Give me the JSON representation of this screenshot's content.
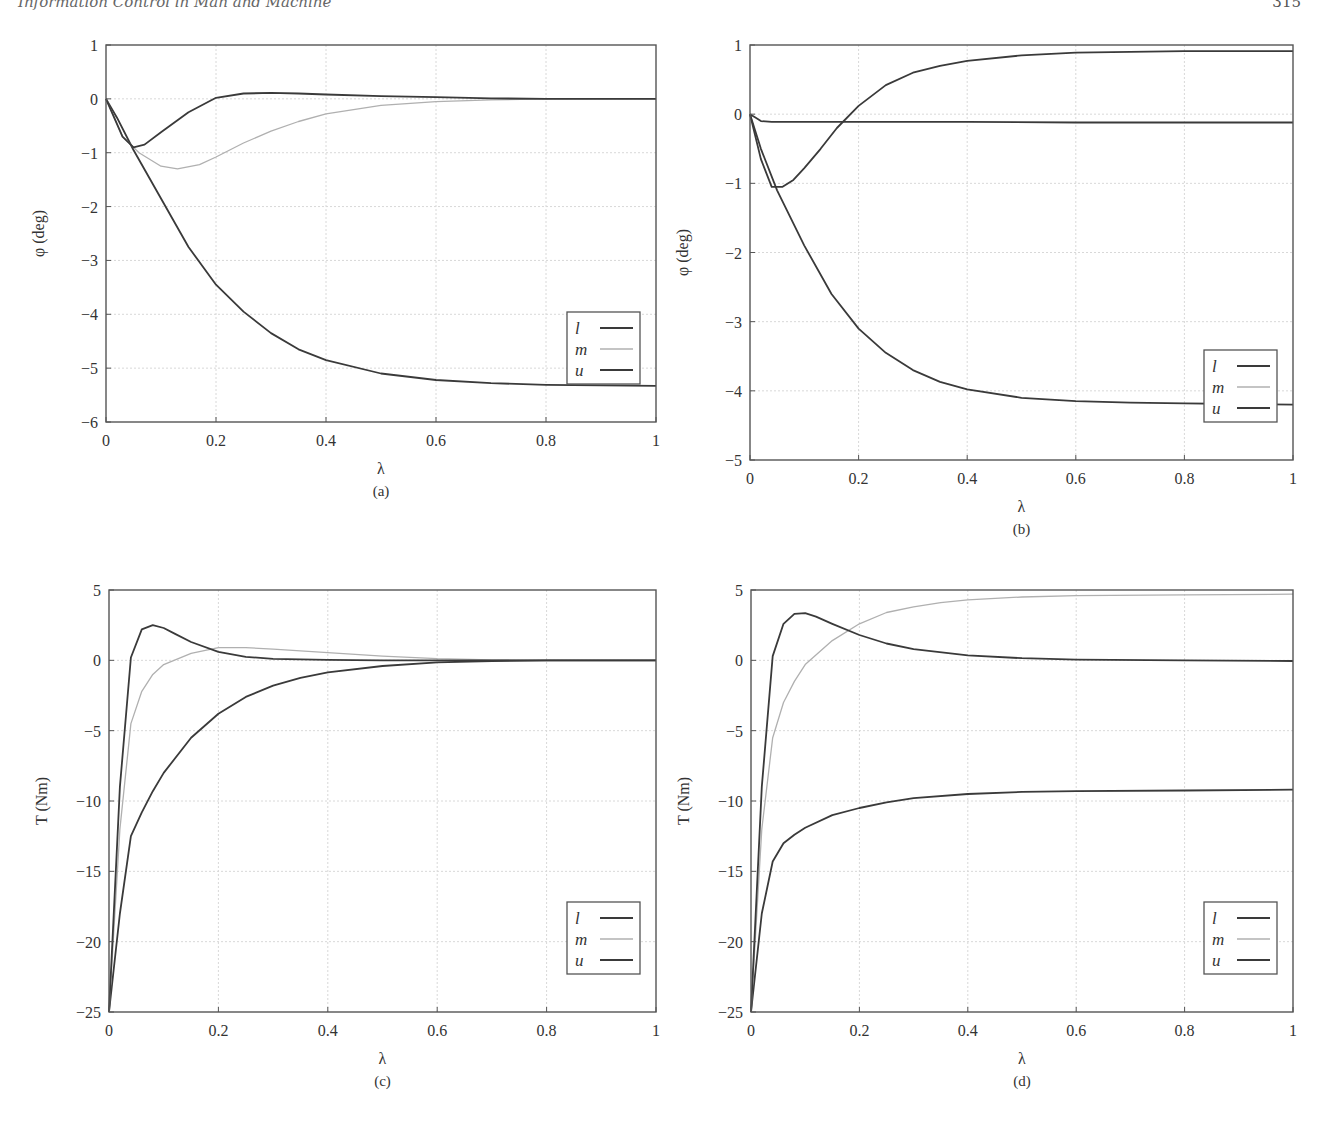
{
  "page": {
    "running_head": "Information Control in Man and Machine",
    "page_number": "315"
  },
  "style": {
    "dark_line": "#3a3a3a",
    "light_line": "#b0b0b0",
    "grid": "#d8d8d8",
    "axis": "#555555"
  },
  "chart_data": [
    {
      "id": "a",
      "type": "line",
      "caption": "(a)",
      "xlabel": "λ",
      "ylabel": "φ (deg)",
      "xlim": [
        0,
        1
      ],
      "ylim": [
        -6,
        1
      ],
      "xticks": [
        0,
        0.2,
        0.4,
        0.6,
        0.8,
        1
      ],
      "xtick_labels": [
        "0",
        "0.2",
        "0.4",
        "0.6",
        "0.8",
        "1"
      ],
      "yticks": [
        1,
        0,
        -1,
        -2,
        -3,
        -4,
        -5,
        -6
      ],
      "ytick_labels": [
        "1",
        "0",
        "−1",
        "−2",
        "−3",
        "−4",
        "−5",
        "−6"
      ],
      "grid": true,
      "legend_position": "lower right",
      "legend": [
        "l",
        "m",
        "u"
      ],
      "frame": {
        "x0": 106,
        "x1": 656,
        "y0": 45,
        "y1": 422
      },
      "series": [
        {
          "name": "l",
          "color": "dark",
          "x": [
            0,
            0.02,
            0.05,
            0.1,
            0.15,
            0.2,
            0.25,
            0.3,
            0.35,
            0.4,
            0.5,
            0.6,
            0.7,
            0.8,
            0.9,
            1
          ],
          "y": [
            0,
            -0.35,
            -0.95,
            -1.85,
            -2.75,
            -3.45,
            -3.95,
            -4.35,
            -4.65,
            -4.85,
            -5.1,
            -5.22,
            -5.28,
            -5.31,
            -5.32,
            -5.33
          ]
        },
        {
          "name": "m",
          "color": "light",
          "x": [
            0,
            0.03,
            0.06,
            0.1,
            0.13,
            0.17,
            0.2,
            0.25,
            0.3,
            0.35,
            0.4,
            0.5,
            0.6,
            0.7,
            0.8,
            1
          ],
          "y": [
            0,
            -0.7,
            -1.0,
            -1.25,
            -1.3,
            -1.22,
            -1.08,
            -0.82,
            -0.6,
            -0.42,
            -0.28,
            -0.12,
            -0.05,
            -0.02,
            0,
            0
          ]
        },
        {
          "name": "u",
          "color": "dark",
          "x": [
            0,
            0.03,
            0.05,
            0.07,
            0.1,
            0.15,
            0.2,
            0.25,
            0.3,
            0.35,
            0.4,
            0.5,
            0.6,
            0.7,
            0.8,
            1
          ],
          "y": [
            0,
            -0.7,
            -0.9,
            -0.85,
            -0.62,
            -0.25,
            0.02,
            0.1,
            0.11,
            0.1,
            0.08,
            0.05,
            0.03,
            0.01,
            0,
            0
          ]
        }
      ]
    },
    {
      "id": "b",
      "type": "line",
      "caption": "(b)",
      "xlabel": "λ",
      "ylabel": "φ (deg)",
      "xlim": [
        0,
        1
      ],
      "ylim": [
        -5,
        1
      ],
      "xticks": [
        0,
        0.2,
        0.4,
        0.6,
        0.8,
        1
      ],
      "xtick_labels": [
        "0",
        "0.2",
        "0.4",
        "0.6",
        "0.8",
        "1"
      ],
      "yticks": [
        1,
        0,
        -1,
        -2,
        -3,
        -4,
        -5
      ],
      "ytick_labels": [
        "1",
        "0",
        "−1",
        "−2",
        "−3",
        "−4",
        "−5"
      ],
      "grid": true,
      "legend_position": "lower right",
      "legend": [
        "l",
        "m",
        "u"
      ],
      "frame": {
        "x0": 750,
        "x1": 1293,
        "y0": 45,
        "y1": 460
      },
      "series": [
        {
          "name": "l",
          "color": "dark",
          "x": [
            0,
            0.02,
            0.05,
            0.1,
            0.15,
            0.2,
            0.25,
            0.3,
            0.35,
            0.4,
            0.5,
            0.6,
            0.7,
            0.8,
            0.9,
            1
          ],
          "y": [
            0,
            -0.5,
            -1.1,
            -1.9,
            -2.6,
            -3.1,
            -3.45,
            -3.7,
            -3.87,
            -3.98,
            -4.1,
            -4.15,
            -4.17,
            -4.18,
            -4.19,
            -4.2
          ]
        },
        {
          "name": "m",
          "color": "dark",
          "x": [
            0,
            0.01,
            0.02,
            0.04,
            0.2,
            0.4,
            0.6,
            0.8,
            1
          ],
          "y": [
            0,
            -0.05,
            -0.1,
            -0.11,
            -0.11,
            -0.11,
            -0.12,
            -0.12,
            -0.12
          ]
        },
        {
          "name": "u",
          "color": "dark",
          "x": [
            0,
            0.02,
            0.04,
            0.06,
            0.08,
            0.1,
            0.13,
            0.16,
            0.2,
            0.25,
            0.3,
            0.35,
            0.4,
            0.5,
            0.6,
            0.7,
            0.8,
            1
          ],
          "y": [
            0,
            -0.65,
            -1.05,
            -1.05,
            -0.95,
            -0.78,
            -0.5,
            -0.2,
            0.12,
            0.42,
            0.6,
            0.7,
            0.77,
            0.85,
            0.89,
            0.9,
            0.91,
            0.91
          ]
        }
      ]
    },
    {
      "id": "c",
      "type": "line",
      "caption": "(c)",
      "xlabel": "λ",
      "ylabel": "T (Nm)",
      "xlim": [
        0,
        1
      ],
      "ylim": [
        -25,
        5
      ],
      "xticks": [
        0,
        0.2,
        0.4,
        0.6,
        0.8,
        1
      ],
      "xtick_labels": [
        "0",
        "0.2",
        "0.4",
        "0.6",
        "0.8",
        "1"
      ],
      "yticks": [
        5,
        0,
        -5,
        -10,
        -15,
        -20,
        -25
      ],
      "ytick_labels": [
        "5",
        "0",
        "−5",
        "−10",
        "−15",
        "−20",
        "−25"
      ],
      "grid": true,
      "legend_position": "lower right",
      "legend": [
        "l",
        "m",
        "u"
      ],
      "frame": {
        "x0": 109,
        "x1": 656,
        "y0": 590,
        "y1": 1012
      },
      "series": [
        {
          "name": "l",
          "color": "dark",
          "x": [
            0,
            0.02,
            0.04,
            0.06,
            0.08,
            0.1,
            0.15,
            0.2,
            0.25,
            0.3,
            0.35,
            0.4,
            0.5,
            0.6,
            0.7,
            0.8,
            1
          ],
          "y": [
            -25,
            -18,
            -12.5,
            -10.8,
            -9.3,
            -8.0,
            -5.5,
            -3.8,
            -2.6,
            -1.8,
            -1.25,
            -0.85,
            -0.4,
            -0.15,
            -0.05,
            0,
            0
          ]
        },
        {
          "name": "m",
          "color": "light",
          "x": [
            0,
            0.02,
            0.04,
            0.06,
            0.08,
            0.1,
            0.15,
            0.2,
            0.25,
            0.3,
            0.4,
            0.5,
            0.6,
            0.7,
            0.8,
            1
          ],
          "y": [
            -25,
            -12,
            -4.5,
            -2.2,
            -1.0,
            -0.3,
            0.5,
            0.9,
            0.9,
            0.8,
            0.55,
            0.3,
            0.12,
            0.04,
            0,
            0
          ]
        },
        {
          "name": "u",
          "color": "dark",
          "x": [
            0,
            0.02,
            0.04,
            0.06,
            0.08,
            0.1,
            0.12,
            0.15,
            0.2,
            0.25,
            0.3,
            0.4,
            0.5,
            0.6,
            0.8,
            1
          ],
          "y": [
            -25,
            -9,
            0.2,
            2.2,
            2.5,
            2.3,
            1.9,
            1.3,
            0.6,
            0.25,
            0.1,
            0.03,
            0,
            0,
            0,
            0
          ]
        }
      ]
    },
    {
      "id": "d",
      "type": "line",
      "caption": "(d)",
      "xlabel": "λ",
      "ylabel": "T (Nm)",
      "xlim": [
        0,
        1
      ],
      "ylim": [
        -25,
        5
      ],
      "xticks": [
        0,
        0.2,
        0.4,
        0.6,
        0.8,
        1
      ],
      "xtick_labels": [
        "0",
        "0.2",
        "0.4",
        "0.6",
        "0.8",
        "1"
      ],
      "yticks": [
        5,
        0,
        -5,
        -10,
        -15,
        -20,
        -25
      ],
      "ytick_labels": [
        "5",
        "0",
        "−5",
        "−10",
        "−15",
        "−20",
        "−25"
      ],
      "grid": true,
      "legend_position": "lower right",
      "legend": [
        "l",
        "m",
        "u"
      ],
      "frame": {
        "x0": 751,
        "x1": 1293,
        "y0": 590,
        "y1": 1012
      },
      "series": [
        {
          "name": "l",
          "color": "dark",
          "x": [
            0,
            0.02,
            0.04,
            0.06,
            0.08,
            0.1,
            0.15,
            0.2,
            0.25,
            0.3,
            0.4,
            0.5,
            0.6,
            0.8,
            1
          ],
          "y": [
            -25,
            -18,
            -14.3,
            -13.0,
            -12.4,
            -11.9,
            -11.0,
            -10.5,
            -10.1,
            -9.8,
            -9.5,
            -9.35,
            -9.3,
            -9.25,
            -9.2
          ]
        },
        {
          "name": "m",
          "color": "light",
          "x": [
            0,
            0.02,
            0.04,
            0.06,
            0.08,
            0.1,
            0.15,
            0.2,
            0.25,
            0.3,
            0.35,
            0.4,
            0.5,
            0.6,
            0.8,
            1
          ],
          "y": [
            -25,
            -12,
            -5.5,
            -3.0,
            -1.5,
            -0.3,
            1.4,
            2.6,
            3.4,
            3.8,
            4.1,
            4.3,
            4.5,
            4.6,
            4.65,
            4.7
          ]
        },
        {
          "name": "u",
          "color": "dark",
          "x": [
            0,
            0.02,
            0.04,
            0.06,
            0.08,
            0.1,
            0.12,
            0.15,
            0.2,
            0.25,
            0.3,
            0.4,
            0.5,
            0.6,
            0.8,
            1
          ],
          "y": [
            -25,
            -9,
            0.3,
            2.6,
            3.3,
            3.35,
            3.1,
            2.6,
            1.8,
            1.2,
            0.8,
            0.35,
            0.15,
            0.05,
            0,
            -0.05
          ]
        }
      ]
    }
  ]
}
